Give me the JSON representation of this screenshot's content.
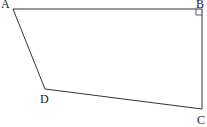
{
  "diagram": {
    "type": "quadrilateral",
    "vertices": [
      {
        "label": "A",
        "x": 13,
        "y": 9,
        "lx": 1,
        "ly": 8
      },
      {
        "label": "B",
        "x": 202,
        "y": 9,
        "lx": 196,
        "ly": 8
      },
      {
        "label": "C",
        "x": 202,
        "y": 109,
        "lx": 197,
        "ly": 124
      },
      {
        "label": "D",
        "x": 45,
        "y": 89,
        "lx": 40,
        "ly": 103
      }
    ],
    "right_angle_at": "B",
    "stroke_color": "#333333"
  }
}
